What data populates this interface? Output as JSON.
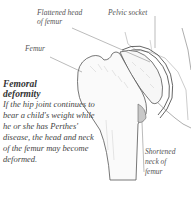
{
  "diagram": {
    "labels": {
      "flattened_head": "Flattened head of femur",
      "flattened_head_line1": "Flattened head",
      "flattened_head_line2": "of femur",
      "pelvic_socket": "Pelvic socket",
      "femur": "Femur",
      "shortened_neck_line1": "Shortened",
      "shortened_neck_line2": "neck of",
      "shortened_neck_line3": "femur"
    },
    "caption": {
      "title_line1": "Femoral",
      "title_line2": "deformity",
      "body": "If the hip joint continues to bear a child's weight while he or she has Perthes' disease, the head and neck of the femur may become deformed."
    },
    "colors": {
      "line": "#555555",
      "shading": "#c8c8c8",
      "background": "#ffffff"
    }
  }
}
